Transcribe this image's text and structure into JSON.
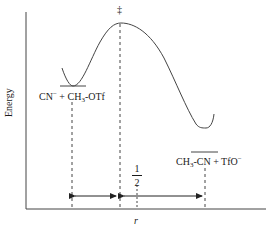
{
  "diagram": {
    "type": "reaction-energy-profile",
    "axes": {
      "y_label": "Energy",
      "x_label": "r"
    },
    "transition_state_marker": "‡",
    "reactants": {
      "label_main": "CN",
      "label_charge": "−",
      "label_plus": " + CH",
      "label_sub": "3",
      "label_rest": "-OTf"
    },
    "products": {
      "label_main": "CH",
      "label_sub": "3",
      "label_mid": "-CN + TfO",
      "label_charge": "−"
    },
    "fraction": {
      "numerator": "1",
      "denominator": "2"
    },
    "colors": {
      "line": "#333333",
      "background": "#ffffff"
    }
  }
}
